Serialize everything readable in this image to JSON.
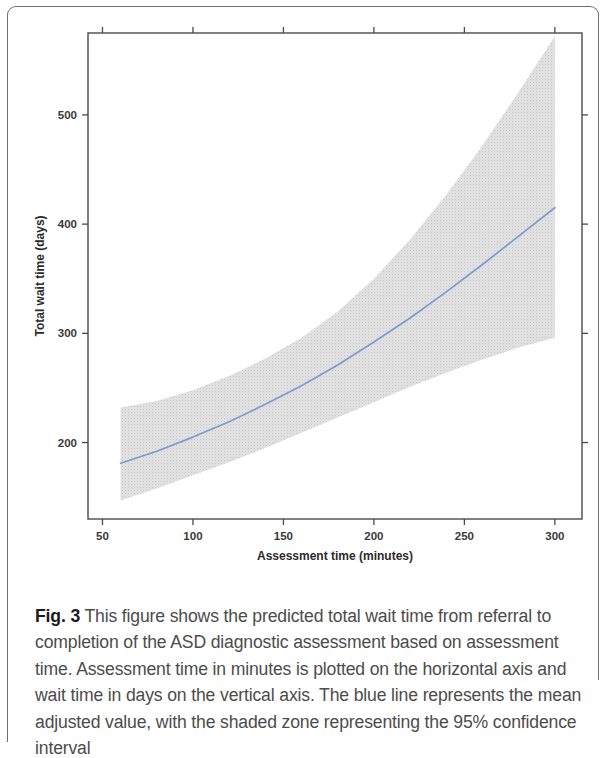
{
  "figure": {
    "label": "Fig. 3",
    "caption": "This figure shows the predicted total wait time from referral to completion of the ASD diagnostic assessment based on assessment time. Assessment time in minutes is plotted on the horizontal axis and wait time in days on the vertical axis. The blue line represents the mean adjusted value, with the shaded zone representing the 95% confidence interval"
  },
  "colors": {
    "line": "#7d9ccd",
    "band": "#dcdcdc",
    "axis": "#4a4a4a",
    "card_border": "#6e6e6e",
    "caption_text": "#4c4c4c"
  },
  "chart_data": {
    "type": "line",
    "title": "",
    "xlabel": "Assessment time (minutes)",
    "ylabel": "Total wait time (days)",
    "xlim": [
      42,
      315
    ],
    "ylim": [
      130,
      575
    ],
    "xticks": [
      50,
      100,
      150,
      200,
      250,
      300
    ],
    "xtick_labels": [
      "50",
      "100",
      "150",
      "200",
      "250",
      "300"
    ],
    "yticks": [
      200,
      300,
      400,
      500
    ],
    "ytick_labels": [
      "200",
      "300",
      "400",
      "500"
    ],
    "grid": false,
    "legend": null,
    "series": [
      {
        "name": "Predicted mean total wait time",
        "style": "line",
        "color": "#7d9ccd",
        "x": [
          60,
          80,
          100,
          120,
          140,
          160,
          180,
          200,
          220,
          240,
          260,
          280,
          300
        ],
        "values": [
          181,
          192,
          205,
          219,
          235,
          252,
          271,
          292,
          314,
          338,
          363,
          389,
          415
        ]
      },
      {
        "name": "95% confidence interval upper bound",
        "style": "band-upper",
        "color": "#dcdcdc",
        "x": [
          60,
          80,
          100,
          120,
          140,
          160,
          180,
          200,
          220,
          240,
          260,
          280,
          300
        ],
        "values": [
          232,
          238,
          248,
          261,
          277,
          296,
          320,
          350,
          386,
          427,
          472,
          521,
          572
        ]
      },
      {
        "name": "95% confidence interval lower bound",
        "style": "band-lower",
        "color": "#dcdcdc",
        "x": [
          60,
          80,
          100,
          120,
          140,
          160,
          180,
          200,
          220,
          240,
          260,
          280,
          300
        ],
        "values": [
          147,
          158,
          170,
          182,
          195,
          209,
          223,
          237,
          251,
          264,
          276,
          287,
          296
        ]
      }
    ],
    "annotations": []
  }
}
